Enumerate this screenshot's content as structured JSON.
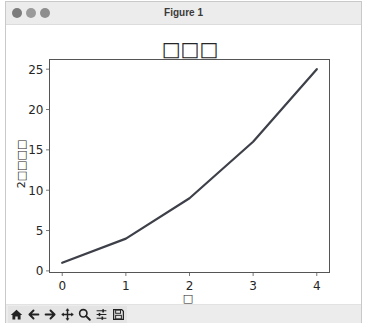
{
  "window": {
    "title": "Figure 1",
    "traffic_lights": [
      "close",
      "minimize",
      "zoom"
    ]
  },
  "toolbar": {
    "buttons": [
      {
        "name": "home",
        "icon": "home-icon"
      },
      {
        "name": "back",
        "icon": "arrow-left-icon"
      },
      {
        "name": "forward",
        "icon": "arrow-right-icon"
      },
      {
        "name": "pan",
        "icon": "move-icon"
      },
      {
        "name": "zoom",
        "icon": "magnifier-icon"
      },
      {
        "name": "configure-subplots",
        "icon": "sliders-icon"
      },
      {
        "name": "save",
        "icon": "floppy-disk-icon"
      }
    ]
  },
  "colors": {
    "line": "#3d4048",
    "axes": "#555555",
    "text": "#262626"
  },
  "chart_data": {
    "type": "line",
    "title": "□□□",
    "xlabel": "□",
    "ylabel": "2□□□□",
    "x": [
      0,
      1,
      2,
      3,
      4
    ],
    "series": [
      {
        "name": "y",
        "values": [
          1,
          4,
          9,
          16,
          25
        ]
      }
    ],
    "xticks": [
      "0",
      "1",
      "2",
      "3",
      "4"
    ],
    "yticks": [
      "0",
      "5",
      "10",
      "15",
      "20",
      "25"
    ],
    "xlim": [
      -0.2,
      4.2
    ],
    "ylim": [
      -0.2,
      26.2
    ],
    "grid": false,
    "legend": null
  }
}
